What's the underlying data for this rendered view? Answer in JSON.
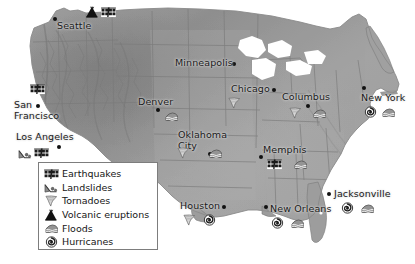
{
  "map": {
    "title": "United States natural hazards map",
    "land_color": "#9a9a9a",
    "water_color": "#ffffff",
    "border_color": "#6e6e6e",
    "label_color": "#1a1a1a"
  },
  "legend": {
    "name": "hazard-legend",
    "items": [
      {
        "icon": "earthquake-icon",
        "label": "Earthquakes"
      },
      {
        "icon": "landslide-icon",
        "label": "Landslides"
      },
      {
        "icon": "tornado-icon",
        "label": "Tornadoes"
      },
      {
        "icon": "volcano-icon",
        "label": "Volcanic eruptions"
      },
      {
        "icon": "flood-icon",
        "label": "Floods"
      },
      {
        "icon": "hurricane-icon",
        "label": "Hurricanes"
      }
    ]
  },
  "cities": [
    {
      "name": "Seattle",
      "label": "Seattle",
      "x": 57,
      "y": 20,
      "dot_x": 53,
      "dot_y": 17,
      "two_line": false,
      "hazards": [
        "volcano-icon",
        "earthquake-icon"
      ]
    },
    {
      "name": "San Francisco",
      "label": "San Francisco",
      "x": 14,
      "y": 99,
      "dot_x": 36,
      "dot_y": 104,
      "two_line": true,
      "hazards": [
        "earthquake-icon"
      ]
    },
    {
      "name": "Los Angeles",
      "label": "Los Angeles",
      "x": 16,
      "y": 131,
      "dot_x": 57,
      "dot_y": 145,
      "two_line": false,
      "hazards": [
        "landslide-icon",
        "earthquake-icon"
      ]
    },
    {
      "name": "Denver",
      "label": "Denver",
      "x": 138,
      "y": 96,
      "dot_x": 156,
      "dot_y": 108,
      "two_line": false,
      "hazards": [
        "flood-icon"
      ]
    },
    {
      "name": "Minneapolis",
      "label": "Minneapolis",
      "x": 175,
      "y": 57,
      "dot_x": 232,
      "dot_y": 62,
      "two_line": false,
      "hazards": []
    },
    {
      "name": "Oklahoma City",
      "label": "Oklahoma City",
      "x": 178,
      "y": 129,
      "dot_x": 208,
      "dot_y": 152,
      "two_line": true,
      "hazards": [
        "tornado-icon",
        "flood-icon"
      ]
    },
    {
      "name": "Chicago",
      "label": "Chicago",
      "x": 231,
      "y": 83,
      "dot_x": 272,
      "dot_y": 88,
      "two_line": false,
      "hazards": [
        "tornado-icon"
      ]
    },
    {
      "name": "Columbus",
      "label": "Columbus",
      "x": 282,
      "y": 91,
      "dot_x": 306,
      "dot_y": 104,
      "two_line": false,
      "hazards": [
        "tornado-icon",
        "flood-icon"
      ]
    },
    {
      "name": "Memphis",
      "label": "Memphis",
      "x": 263,
      "y": 144,
      "dot_x": 259,
      "dot_y": 155,
      "two_line": false,
      "hazards": [
        "earthquake-icon",
        "flood-icon"
      ]
    },
    {
      "name": "New York",
      "label": "New York",
      "x": 361,
      "y": 92,
      "dot_x": 362,
      "dot_y": 86,
      "two_line": false,
      "hazards": [
        "hurricane-icon",
        "flood-icon"
      ]
    },
    {
      "name": "Houston",
      "label": "Houston",
      "x": 180,
      "y": 200,
      "dot_x": 222,
      "dot_y": 205,
      "two_line": false,
      "hazards": [
        "tornado-icon",
        "hurricane-icon"
      ]
    },
    {
      "name": "New Orleans",
      "label": "New Orleans",
      "x": 270,
      "y": 203,
      "dot_x": 264,
      "dot_y": 205,
      "two_line": false,
      "hazards": [
        "hurricane-icon",
        "flood-icon"
      ]
    },
    {
      "name": "Jacksonville",
      "label": "Jacksonville",
      "x": 334,
      "y": 188,
      "dot_x": 327,
      "dot_y": 192,
      "two_line": false,
      "hazards": [
        "hurricane-icon",
        "flood-icon"
      ]
    }
  ]
}
